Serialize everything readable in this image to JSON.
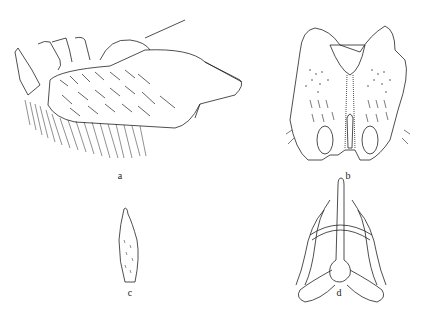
{
  "figure": {
    "type": "scientific line illustration",
    "panels": [
      {
        "id": "a",
        "label": "a",
        "view": "lateral view, setose segment with appendages"
      },
      {
        "id": "b",
        "label": "b",
        "view": "ventral view, bilobed plate with setae"
      },
      {
        "id": "c",
        "label": "c",
        "view": "isolated setose lobe"
      },
      {
        "id": "d",
        "label": "d",
        "view": "sclerotized apparatus, dorsal view"
      }
    ],
    "colors": {
      "ink": "#222222",
      "background": "#ffffff"
    }
  }
}
